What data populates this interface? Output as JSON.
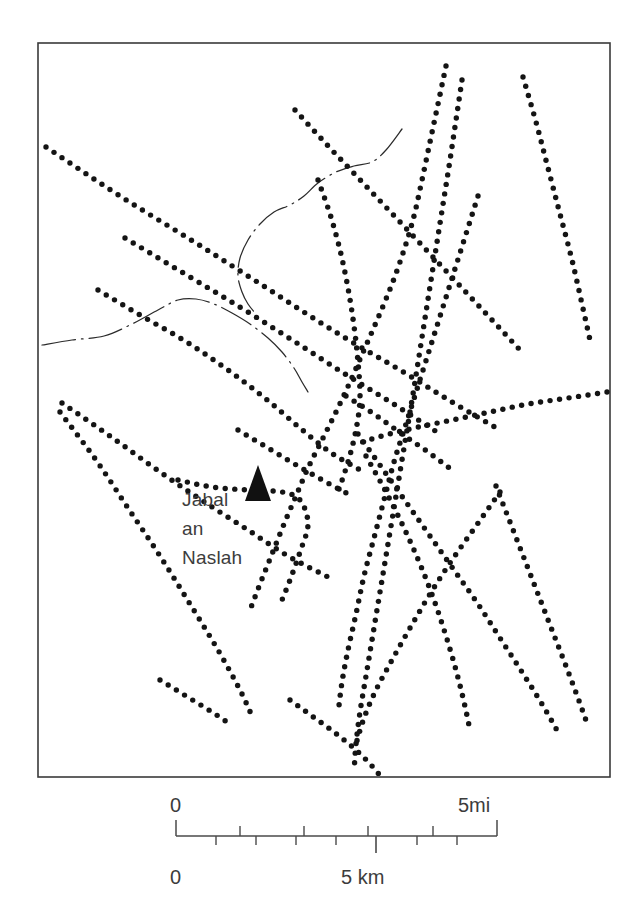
{
  "figure": {
    "kind": "topographic-sketch-map",
    "background_color": "#ffffff",
    "ink_color": "#141414",
    "frame": {
      "x": 38,
      "y": 43,
      "width": 572,
      "height": 734,
      "stroke": "#3a3a3a"
    }
  },
  "labels": {
    "place_name_lines": [
      "Jabal",
      "an",
      "Naslah"
    ],
    "place_name_full": "Jabal an Naslah"
  },
  "symbols": {
    "peak": {
      "name": "mountain-peak-triangle",
      "x": 258,
      "y": 489,
      "half_width": 13,
      "height": 24
    }
  },
  "scale_bar": {
    "x_start": 176,
    "x_end": 497,
    "y_axis": 836,
    "miles": {
      "unit_label": "5mi",
      "zero_label": "0",
      "tick_values": [
        0,
        1,
        2,
        3,
        4,
        5
      ],
      "tick_x": [
        176,
        240,
        304,
        368,
        433,
        497
      ],
      "tick_side": "above",
      "tick_length": 10
    },
    "kilometers": {
      "unit_label": "5 km",
      "zero_label": "0",
      "tick_values": [
        0,
        1,
        2,
        3,
        4,
        5,
        6,
        7,
        8
      ],
      "tick_x": [
        176,
        216,
        256,
        296,
        336,
        376,
        417,
        457,
        497
      ],
      "tick_side": "below",
      "tick_length": 9,
      "major_tick_value": 5,
      "major_tick_x": 376
    },
    "labels": {
      "left_top": "0",
      "left_bottom": "0",
      "right_top": "5mi",
      "center_bottom": "5 km"
    }
  },
  "map_features": {
    "dot_radius": 2.7,
    "dot_spacing": 9.6,
    "tracks": [
      {
        "name": "track-nw-to-center",
        "points": [
          [
            46,
            147
          ],
          [
            120,
            196
          ],
          [
            196,
            243
          ],
          [
            262,
            285
          ],
          [
            310,
            316
          ],
          [
            352,
            342
          ],
          [
            400,
            370
          ],
          [
            452,
            402
          ],
          [
            500,
            430
          ]
        ]
      },
      {
        "name": "track-nw-lower-branch",
        "points": [
          [
            125,
            238
          ],
          [
            185,
            274
          ],
          [
            243,
            309
          ],
          [
            300,
            345
          ],
          [
            345,
            374
          ],
          [
            392,
            403
          ],
          [
            440,
            434
          ]
        ]
      },
      {
        "name": "track-west-arc-to-peak",
        "points": [
          [
            98,
            290
          ],
          [
            140,
            315
          ],
          [
            185,
            341
          ],
          [
            228,
            370
          ],
          [
            266,
            399
          ],
          [
            300,
            428
          ],
          [
            330,
            452
          ],
          [
            360,
            470
          ]
        ]
      },
      {
        "name": "track-west-lower-to-peak",
        "points": [
          [
            62,
            403
          ],
          [
            110,
            436
          ],
          [
            160,
            472
          ],
          [
            206,
            503
          ],
          [
            248,
            530
          ],
          [
            288,
            556
          ],
          [
            330,
            578
          ]
        ]
      },
      {
        "name": "track-sw-long",
        "points": [
          [
            60,
            412
          ],
          [
            96,
            460
          ],
          [
            128,
            508
          ],
          [
            160,
            556
          ],
          [
            190,
            604
          ],
          [
            218,
            650
          ],
          [
            240,
            690
          ],
          [
            252,
            716
          ]
        ]
      },
      {
        "name": "track-south-from-peak",
        "points": [
          [
            178,
            480
          ],
          [
            212,
            487
          ],
          [
            248,
            490
          ],
          [
            282,
            492
          ],
          [
            300,
            500
          ],
          [
            308,
            524
          ],
          [
            300,
            552
          ],
          [
            290,
            580
          ],
          [
            282,
            600
          ]
        ]
      },
      {
        "name": "track-center-down-sw",
        "points": [
          [
            318,
            180
          ],
          [
            330,
            214
          ],
          [
            340,
            250
          ],
          [
            348,
            288
          ],
          [
            354,
            326
          ],
          [
            358,
            362
          ],
          [
            360,
            398
          ],
          [
            356,
            430
          ],
          [
            348,
            462
          ],
          [
            338,
            492
          ]
        ]
      },
      {
        "name": "track-nne-through-center",
        "points": [
          [
            295,
            110
          ],
          [
            330,
            148
          ],
          [
            366,
            186
          ],
          [
            400,
            222
          ],
          [
            432,
            256
          ],
          [
            462,
            288
          ],
          [
            492,
            320
          ],
          [
            520,
            350
          ]
        ]
      },
      {
        "name": "track-ne-steep-left",
        "points": [
          [
            446,
            66
          ],
          [
            438,
            104
          ],
          [
            430,
            142
          ],
          [
            422,
            180
          ],
          [
            414,
            216
          ],
          [
            404,
            250
          ],
          [
            392,
            284
          ],
          [
            378,
            318
          ],
          [
            364,
            350
          ],
          [
            350,
            382
          ],
          [
            336,
            412
          ],
          [
            322,
            440
          ],
          [
            308,
            468
          ],
          [
            296,
            496
          ],
          [
            284,
            524
          ],
          [
            272,
            554
          ],
          [
            260,
            584
          ],
          [
            250,
            610
          ]
        ]
      },
      {
        "name": "track-ne-steep-right",
        "points": [
          [
            462,
            80
          ],
          [
            456,
            120
          ],
          [
            450,
            160
          ],
          [
            444,
            198
          ],
          [
            438,
            236
          ],
          [
            432,
            274
          ],
          [
            426,
            312
          ],
          [
            420,
            350
          ],
          [
            414,
            388
          ],
          [
            408,
            424
          ],
          [
            402,
            460
          ],
          [
            396,
            496
          ],
          [
            390,
            532
          ],
          [
            384,
            568
          ],
          [
            378,
            604
          ],
          [
            372,
            640
          ],
          [
            366,
            676
          ],
          [
            360,
            712
          ],
          [
            356,
            744
          ],
          [
            354,
            772
          ]
        ]
      },
      {
        "name": "track-far-ne-descending",
        "points": [
          [
            523,
            77
          ],
          [
            536,
            122
          ],
          [
            548,
            168
          ],
          [
            560,
            214
          ],
          [
            572,
            260
          ],
          [
            582,
            304
          ],
          [
            590,
            340
          ]
        ]
      },
      {
        "name": "track-east-spur-to-center",
        "points": [
          [
            607,
            392
          ],
          [
            568,
            398
          ],
          [
            528,
            404
          ],
          [
            490,
            412
          ],
          [
            452,
            420
          ],
          [
            414,
            428
          ],
          [
            382,
            436
          ],
          [
            356,
            444
          ]
        ]
      },
      {
        "name": "track-ne-mid-descending",
        "points": [
          [
            478,
            196
          ],
          [
            466,
            234
          ],
          [
            454,
            272
          ],
          [
            442,
            310
          ],
          [
            430,
            348
          ],
          [
            418,
            386
          ],
          [
            406,
            424
          ],
          [
            394,
            462
          ],
          [
            384,
            500
          ],
          [
            374,
            538
          ],
          [
            364,
            576
          ],
          [
            356,
            614
          ],
          [
            348,
            650
          ],
          [
            342,
            682
          ],
          [
            338,
            714
          ]
        ]
      },
      {
        "name": "track-center-se-long",
        "points": [
          [
            358,
            434
          ],
          [
            382,
            468
          ],
          [
            406,
            502
          ],
          [
            430,
            536
          ],
          [
            454,
            570
          ],
          [
            478,
            604
          ],
          [
            500,
            638
          ],
          [
            522,
            672
          ],
          [
            542,
            704
          ],
          [
            558,
            732
          ]
        ]
      },
      {
        "name": "track-se-from-center",
        "points": [
          [
            366,
            456
          ],
          [
            386,
            492
          ],
          [
            404,
            528
          ],
          [
            420,
            564
          ],
          [
            434,
            600
          ],
          [
            446,
            636
          ],
          [
            456,
            670
          ],
          [
            464,
            702
          ],
          [
            470,
            730
          ]
        ]
      },
      {
        "name": "track-se-right-descending",
        "points": [
          [
            496,
            486
          ],
          [
            510,
            522
          ],
          [
            524,
            558
          ],
          [
            538,
            594
          ],
          [
            552,
            630
          ],
          [
            566,
            666
          ],
          [
            578,
            698
          ],
          [
            588,
            726
          ]
        ]
      },
      {
        "name": "track-se-crossing-left",
        "points": [
          [
            500,
            492
          ],
          [
            476,
            526
          ],
          [
            452,
            560
          ],
          [
            430,
            594
          ],
          [
            410,
            628
          ],
          [
            392,
            660
          ],
          [
            376,
            690
          ],
          [
            364,
            718
          ],
          [
            356,
            744
          ]
        ]
      },
      {
        "name": "track-south-center-short",
        "points": [
          [
            290,
            700
          ],
          [
            312,
            716
          ],
          [
            334,
            732
          ],
          [
            356,
            750
          ],
          [
            372,
            766
          ],
          [
            382,
            778
          ]
        ]
      },
      {
        "name": "track-south-left-short",
        "points": [
          [
            160,
            680
          ],
          [
            186,
            696
          ],
          [
            212,
            712
          ],
          [
            230,
            724
          ]
        ]
      },
      {
        "name": "track-inner-diagonal-a",
        "points": [
          [
            238,
            430
          ],
          [
            268,
            448
          ],
          [
            298,
            466
          ],
          [
            326,
            482
          ],
          [
            352,
            496
          ]
        ]
      },
      {
        "name": "track-inner-diagonal-b",
        "points": [
          [
            346,
            396
          ],
          [
            374,
            414
          ],
          [
            402,
            434
          ],
          [
            428,
            452
          ],
          [
            452,
            470
          ]
        ]
      }
    ],
    "wadis": [
      {
        "name": "wadi-upper",
        "points": [
          [
            402,
            129
          ],
          [
            386,
            150
          ],
          [
            372,
            162
          ],
          [
            354,
            166
          ],
          [
            336,
            172
          ],
          [
            318,
            183
          ],
          [
            304,
            196
          ],
          [
            290,
            205
          ],
          [
            274,
            212
          ],
          [
            260,
            224
          ],
          [
            248,
            240
          ],
          [
            240,
            258
          ],
          [
            238,
            276
          ],
          [
            242,
            292
          ],
          [
            248,
            304
          ],
          [
            256,
            314
          ]
        ]
      },
      {
        "name": "wadi-lower",
        "points": [
          [
            42,
            345
          ],
          [
            72,
            340
          ],
          [
            104,
            336
          ],
          [
            132,
            324
          ],
          [
            158,
            310
          ],
          [
            178,
            300
          ],
          [
            196,
            299
          ],
          [
            214,
            304
          ],
          [
            232,
            313
          ],
          [
            250,
            324
          ],
          [
            268,
            338
          ],
          [
            282,
            352
          ],
          [
            294,
            368
          ],
          [
            302,
            382
          ],
          [
            308,
            392
          ]
        ]
      }
    ]
  }
}
